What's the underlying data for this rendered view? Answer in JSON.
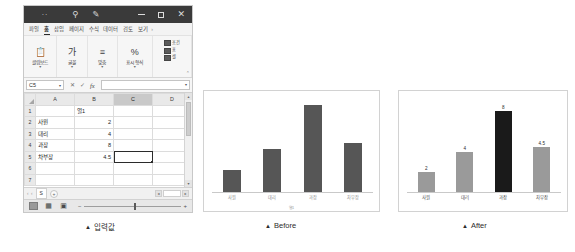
{
  "window": {
    "titlebar": {
      "menu_dots": "··",
      "search_icon": "search-icon",
      "pen_icon": "pen-icon",
      "minimize_label": "—",
      "maximize_label": "□",
      "close_label": "✕"
    },
    "ribbon_tabs": [
      {
        "label": "파일",
        "active": false
      },
      {
        "label": "홈",
        "active": true
      },
      {
        "label": "삽입",
        "active": false
      },
      {
        "label": "페이지",
        "active": false
      },
      {
        "label": "수식",
        "active": false
      },
      {
        "label": "데이터",
        "active": false
      },
      {
        "label": "검토",
        "active": false
      },
      {
        "label": "보기",
        "active": false
      }
    ],
    "ribbon_more": "›",
    "ribbon_groups": [
      {
        "label": "클립보드",
        "icon": "clipboard-icon",
        "glyph": "Ὄb",
        "caret": "▾"
      },
      {
        "label": "글꼴",
        "icon": "font-icon",
        "glyph": "가",
        "caret": "▾"
      },
      {
        "label": "맞춤",
        "icon": "align-icon",
        "glyph": "≡",
        "caret": "▾"
      },
      {
        "label": "표시 형식",
        "icon": "percent-icon",
        "glyph": "%",
        "caret": "▾"
      }
    ],
    "styles_group": {
      "items": [
        {
          "label": "조건",
          "icon": "conditional-format-icon"
        },
        {
          "label": "표",
          "icon": "table-style-icon"
        },
        {
          "label": "셀",
          "icon": "cell-style-icon"
        }
      ],
      "caret": "▾"
    },
    "ribbon_collapse": "⌃",
    "formula_bar": {
      "name_box_value": "C5",
      "name_box_caret": "▾",
      "cancel_label": "✕",
      "confirm_label": "✓",
      "fx_label": "fx",
      "input_value": "",
      "expand_caret": "▾"
    },
    "grid": {
      "columns": [
        "A",
        "B",
        "C",
        "D"
      ],
      "selected_column": "C",
      "rows": [
        {
          "num": "1",
          "a": "",
          "b": "열1",
          "c": "",
          "d": ""
        },
        {
          "num": "2",
          "a": "사원",
          "b": "2",
          "c": "",
          "d": ""
        },
        {
          "num": "3",
          "a": "대리",
          "b": "4",
          "c": "",
          "d": ""
        },
        {
          "num": "4",
          "a": "과장",
          "b": "8",
          "c": "",
          "d": ""
        },
        {
          "num": "5",
          "a": "차부장",
          "b": "4.5",
          "c": "",
          "d": ""
        },
        {
          "num": "6",
          "a": "",
          "b": "",
          "c": "",
          "d": ""
        },
        {
          "num": "7",
          "a": "",
          "b": "",
          "c": "",
          "d": ""
        }
      ],
      "active_cell": "C5",
      "scroll_up": "▴",
      "scroll_down": "▾"
    },
    "sheet_tabs": {
      "nav_first": "‹",
      "nav_prev": "‹",
      "nav_next": "›",
      "nav_last": "›",
      "sheet_name": "S",
      "add_sheet": "+",
      "hscroll_left": "◂",
      "hscroll_right": "▸"
    },
    "status_bar": {
      "view_normal": "normal-view-icon",
      "view_layout": "page-layout-icon",
      "view_break": "page-break-icon",
      "zoom_minus": "−",
      "zoom_plus": "+"
    }
  },
  "captions": {
    "input": {
      "marker": "▲",
      "text": "입력값"
    },
    "before": {
      "marker": "▲",
      "text": "Before"
    },
    "after": {
      "marker": "▲",
      "text": "After"
    }
  },
  "chart_data": [
    {
      "id": "before",
      "type": "bar",
      "title": "",
      "categories": [
        "사원",
        "대리",
        "과장",
        "차부장"
      ],
      "values": [
        2,
        4,
        8,
        4.5
      ],
      "bar_colors": [
        "#565656",
        "#565656",
        "#565656",
        "#565656"
      ],
      "show_data_labels": false,
      "xlabel": "열1",
      "ylabel": "",
      "ylim": [
        0,
        9
      ],
      "grid": false,
      "legend": "none"
    },
    {
      "id": "after",
      "type": "bar",
      "title": "",
      "categories": [
        "사원",
        "대리",
        "과장",
        "차부장"
      ],
      "values": [
        2,
        4,
        8,
        4.5
      ],
      "value_labels": [
        "2",
        "4",
        "8",
        "4.5"
      ],
      "bar_colors": [
        "#9a9a9a",
        "#9a9a9a",
        "#1a1a1a",
        "#9a9a9a"
      ],
      "highlight_category": "과장",
      "show_data_labels": true,
      "xlabel": "",
      "ylabel": "",
      "ylim": [
        0,
        9
      ],
      "grid": false,
      "legend": "none"
    }
  ]
}
